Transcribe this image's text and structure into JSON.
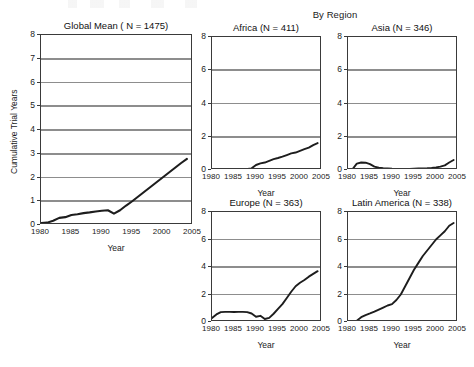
{
  "figure": {
    "group_title": "By Region",
    "x_axis_title": "Year",
    "y_axis_title": "Cumulative Trial Years"
  },
  "chart_data": [
    {
      "type": "line",
      "title": "Global Mean ( N = 1475)",
      "xlabel": "Year",
      "ylabel": "Cumulative Trial Years",
      "xlim": [
        1980,
        2005
      ],
      "ylim": [
        0,
        8
      ],
      "xticks": [
        1980,
        1985,
        1990,
        1995,
        2000,
        2005
      ],
      "yticks": [
        0,
        1,
        2,
        3,
        4,
        5,
        6,
        7,
        8
      ],
      "grid": true,
      "legend": "none",
      "n": 1475,
      "x": [
        1980,
        1981,
        1982,
        1983,
        1984,
        1985,
        1986,
        1987,
        1988,
        1989,
        1990,
        1991,
        1992,
        1993,
        1994,
        1995,
        1996,
        1997,
        1998,
        1999,
        2000,
        2001,
        2002,
        2003,
        2004
      ],
      "values": [
        0.08,
        0.1,
        0.18,
        0.3,
        0.33,
        0.42,
        0.45,
        0.5,
        0.53,
        0.57,
        0.6,
        0.62,
        0.48,
        0.62,
        0.82,
        1.0,
        1.2,
        1.4,
        1.6,
        1.8,
        2.0,
        2.2,
        2.4,
        2.6,
        2.78
      ]
    },
    {
      "type": "line",
      "title": "Africa (N = 411)",
      "xlabel": "Year",
      "ylabel": "",
      "xlim": [
        1980,
        2005
      ],
      "ylim": [
        0,
        8
      ],
      "xticks": [
        1980,
        1985,
        1990,
        1995,
        2000,
        2005
      ],
      "yticks": [
        0,
        2,
        4,
        6,
        8
      ],
      "grid": true,
      "legend": "none",
      "n": 411,
      "x": [
        1980,
        1981,
        1982,
        1983,
        1984,
        1985,
        1986,
        1987,
        1988,
        1989,
        1990,
        1991,
        1992,
        1993,
        1994,
        1995,
        1996,
        1997,
        1998,
        1999,
        2000,
        2001,
        2002,
        2003,
        2004
      ],
      "values": [
        0.02,
        0.02,
        0.02,
        0.02,
        0.03,
        0.03,
        0.04,
        0.05,
        0.06,
        0.1,
        0.3,
        0.4,
        0.45,
        0.55,
        0.65,
        0.72,
        0.8,
        0.9,
        1.0,
        1.05,
        1.15,
        1.25,
        1.35,
        1.5,
        1.62
      ]
    },
    {
      "type": "line",
      "title": "Asia (N = 346)",
      "xlabel": "Year",
      "ylabel": "",
      "xlim": [
        1980,
        2005
      ],
      "ylim": [
        0,
        8
      ],
      "xticks": [
        1980,
        1985,
        1990,
        1995,
        2000,
        2005
      ],
      "yticks": [
        0,
        2,
        4,
        6,
        8
      ],
      "grid": true,
      "legend": "none",
      "n": 346,
      "x": [
        1980,
        1981,
        1982,
        1983,
        1984,
        1985,
        1986,
        1987,
        1988,
        1989,
        1990,
        1991,
        1992,
        1993,
        1994,
        1995,
        1996,
        1997,
        1998,
        1999,
        2000,
        2001,
        2002,
        2003,
        2004
      ],
      "values": [
        0.02,
        0.04,
        0.38,
        0.45,
        0.44,
        0.35,
        0.2,
        0.14,
        0.11,
        0.1,
        0.08,
        0.07,
        0.07,
        0.07,
        0.07,
        0.08,
        0.09,
        0.1,
        0.11,
        0.13,
        0.16,
        0.2,
        0.28,
        0.45,
        0.6
      ]
    },
    {
      "type": "line",
      "title": "Europe (N = 363)",
      "xlabel": "Year",
      "ylabel": "",
      "xlim": [
        1980,
        2005
      ],
      "ylim": [
        0,
        8
      ],
      "xticks": [
        1980,
        1985,
        1990,
        1995,
        2000,
        2005
      ],
      "yticks": [
        0,
        2,
        4,
        6,
        8
      ],
      "grid": true,
      "legend": "none",
      "n": 363,
      "x": [
        1980,
        1981,
        1982,
        1983,
        1984,
        1985,
        1986,
        1987,
        1988,
        1989,
        1990,
        1991,
        1992,
        1993,
        1994,
        1995,
        1996,
        1997,
        1998,
        1999,
        2000,
        2001,
        2002,
        2003,
        2004
      ],
      "values": [
        0.3,
        0.55,
        0.72,
        0.74,
        0.74,
        0.73,
        0.74,
        0.74,
        0.72,
        0.62,
        0.38,
        0.45,
        0.22,
        0.3,
        0.6,
        0.95,
        1.3,
        1.75,
        2.2,
        2.6,
        2.85,
        3.05,
        3.3,
        3.5,
        3.7
      ]
    },
    {
      "type": "line",
      "title": "Latin America (N = 338)",
      "xlabel": "Year",
      "ylabel": "",
      "xlim": [
        1980,
        2005
      ],
      "ylim": [
        0,
        8
      ],
      "xticks": [
        1980,
        1985,
        1990,
        1995,
        2000,
        2005
      ],
      "yticks": [
        0,
        2,
        4,
        6,
        8
      ],
      "grid": true,
      "legend": "none",
      "n": 338,
      "x": [
        1980,
        1981,
        1982,
        1983,
        1984,
        1985,
        1986,
        1987,
        1988,
        1989,
        1990,
        1991,
        1992,
        1993,
        1994,
        1995,
        1996,
        1997,
        1998,
        1999,
        2000,
        2001,
        2002,
        2003,
        2004
      ],
      "values": [
        0.05,
        0.05,
        0.1,
        0.35,
        0.5,
        0.62,
        0.75,
        0.9,
        1.05,
        1.2,
        1.3,
        1.6,
        2.0,
        2.6,
        3.2,
        3.8,
        4.3,
        4.8,
        5.2,
        5.6,
        6.0,
        6.3,
        6.6,
        7.0,
        7.2
      ]
    }
  ]
}
